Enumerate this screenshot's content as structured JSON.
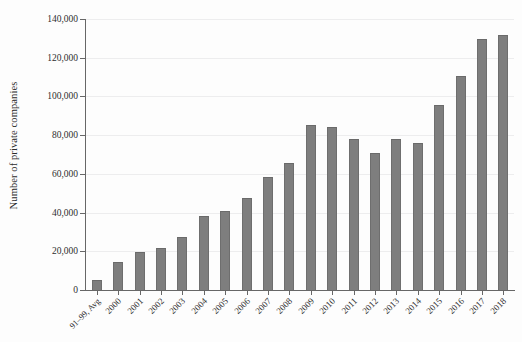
{
  "chart_data": {
    "type": "bar",
    "title": "",
    "xlabel": "",
    "ylabel": "Number of private companies",
    "categories": [
      "91–99, Avg",
      "2000",
      "2001",
      "2002",
      "2003",
      "2004",
      "2005",
      "2006",
      "2007",
      "2008",
      "2009",
      "2010",
      "2011",
      "2012",
      "2013",
      "2014",
      "2015",
      "2016",
      "2017",
      "2018"
    ],
    "values": [
      5000,
      14500,
      19500,
      21500,
      27500,
      38000,
      41000,
      47500,
      58500,
      65500,
      85500,
      84000,
      78000,
      71000,
      78000,
      76000,
      95500,
      110500,
      129500,
      132000
    ],
    "ylim": [
      0,
      140000
    ],
    "y_ticks": [
      0,
      20000,
      40000,
      60000,
      80000,
      100000,
      120000,
      140000
    ],
    "y_tick_labels": [
      "0",
      "20,000",
      "40,000",
      "60,000",
      "80,000",
      "100,000",
      "120,000",
      "140,000"
    ],
    "grid": true,
    "legend": "none",
    "bar_color": "#7e7e7e",
    "gridline_color": "#ededee",
    "axis_color": "#676767",
    "background_color": "#fdfdfd"
  }
}
